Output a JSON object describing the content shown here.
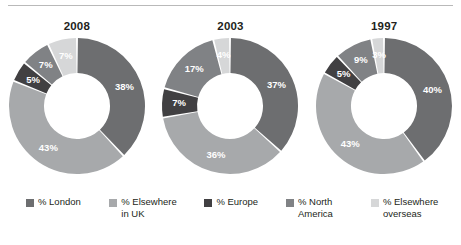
{
  "chart_data": {
    "type": "pie",
    "title": "",
    "subtitle": "",
    "xlabel": "",
    "ylabel": "",
    "legend_position": "bottom",
    "grid": false,
    "categories": [
      "% London",
      "% Elsewhere in UK",
      "% Europe",
      "% North America",
      "% Elsewhere overseas"
    ],
    "category_colors": [
      "#6d6e70",
      "#a7a9ab",
      "#414042",
      "#808285",
      "#d6d7d8"
    ],
    "charts": [
      {
        "title": "2008",
        "values": [
          38,
          43,
          5,
          7,
          7
        ],
        "labels": [
          "38%",
          "43%",
          "5%",
          "7%",
          "7%"
        ]
      },
      {
        "title": "2003",
        "values": [
          37,
          36,
          7,
          17,
          4
        ],
        "labels": [
          "37%",
          "36%",
          "7%",
          "17%",
          "4%"
        ]
      },
      {
        "title": "1997",
        "values": [
          40,
          43,
          5,
          9,
          3
        ],
        "labels": [
          "40%",
          "43%",
          "5%",
          "9%",
          "3%"
        ]
      }
    ]
  },
  "legend": {
    "items": [
      {
        "label": "% London",
        "color": "#6d6e70",
        "icon": "legend-swatch-icon"
      },
      {
        "label": "% Elsewhere\nin UK",
        "color": "#a7a9ab",
        "icon": "legend-swatch-icon"
      },
      {
        "label": "% Europe",
        "color": "#414042",
        "icon": "legend-swatch-icon"
      },
      {
        "label": "% North\nAmerica",
        "color": "#808285",
        "icon": "legend-swatch-icon"
      },
      {
        "label": "% Elsewhere\noverseas",
        "color": "#d6d7d8",
        "icon": "legend-swatch-icon"
      }
    ]
  }
}
